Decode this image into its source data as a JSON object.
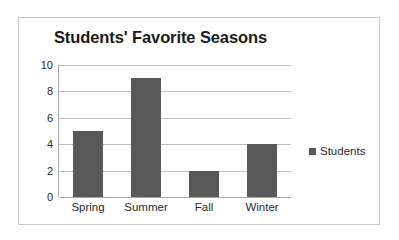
{
  "chart_data": {
    "type": "bar",
    "title": "Students' Favorite Seasons",
    "xlabel": "",
    "ylabel": "",
    "categories": [
      "Spring",
      "Summer",
      "Fall",
      "Winter"
    ],
    "values": [
      5,
      9,
      2,
      4
    ],
    "series": [
      {
        "name": "Students",
        "values": [
          5,
          9,
          2,
          4
        ]
      }
    ],
    "ylim": [
      0,
      10
    ],
    "ytick_labels": [
      "10",
      "8",
      "6",
      "4",
      "2",
      "0"
    ],
    "ytick_values": [
      10,
      8,
      6,
      4,
      2,
      0
    ],
    "grid": true,
    "legend": {
      "position": "right",
      "entries": [
        "Students"
      ]
    },
    "colors": {
      "bar": "#595959",
      "gridline": "#bfbfbf",
      "axis": "#a6a6a6",
      "border": "#c9c9c9",
      "text": "#2b2b2b",
      "title": "#1a1a1a",
      "background": "#ffffff"
    }
  }
}
